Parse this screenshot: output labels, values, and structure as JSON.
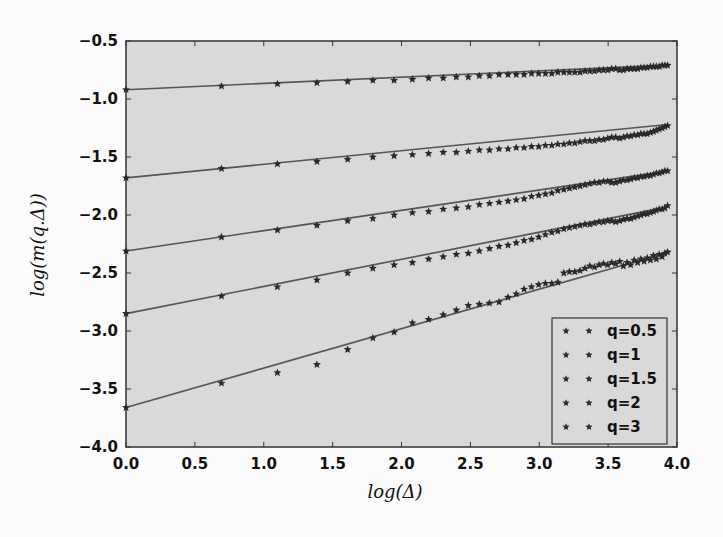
{
  "chart_data": {
    "type": "scatter",
    "title": "",
    "xlabel": "log(Δ)",
    "ylabel": "log(m(q.Δ))",
    "xlim": [
      0.0,
      4.0
    ],
    "ylim": [
      -4.0,
      -0.5
    ],
    "xticks": [
      "0.0",
      "0.5",
      "1.0",
      "1.5",
      "2.0",
      "2.5",
      "3.0",
      "3.5",
      "4.0"
    ],
    "yticks": [
      "-0.5",
      "-1.0",
      "-1.5",
      "-2.0",
      "-2.5",
      "-3.0",
      "-3.5",
      "-4.0"
    ],
    "grid": false,
    "legend_position": "lower right",
    "marker": "*",
    "fit_lines": true,
    "x": [
      0,
      0.693,
      1.099,
      1.386,
      1.609,
      1.792,
      1.946,
      2.079,
      2.197,
      2.303,
      2.398,
      2.485,
      2.565,
      2.639,
      2.708,
      2.773,
      2.833,
      2.89,
      2.944,
      2.996,
      3.045,
      3.091,
      3.135,
      3.178,
      3.219,
      3.258,
      3.296,
      3.332,
      3.367,
      3.401,
      3.434,
      3.466,
      3.497,
      3.526,
      3.555,
      3.584,
      3.611,
      3.638,
      3.664,
      3.689,
      3.714,
      3.738,
      3.761,
      3.784,
      3.807,
      3.829,
      3.85,
      3.871,
      3.892,
      3.912,
      3.932
    ],
    "series": [
      {
        "name": "q=0.5",
        "fit": {
          "intercept": -0.92,
          "slope": 0.054
        },
        "values": [
          -0.92,
          -0.89,
          -0.87,
          -0.86,
          -0.85,
          -0.84,
          -0.84,
          -0.83,
          -0.82,
          -0.82,
          -0.81,
          -0.81,
          -0.8,
          -0.8,
          -0.79,
          -0.79,
          -0.79,
          -0.79,
          -0.78,
          -0.78,
          -0.78,
          -0.78,
          -0.77,
          -0.77,
          -0.77,
          -0.77,
          -0.77,
          -0.76,
          -0.76,
          -0.76,
          -0.75,
          -0.75,
          -0.75,
          -0.74,
          -0.74,
          -0.75,
          -0.75,
          -0.74,
          -0.74,
          -0.74,
          -0.74,
          -0.73,
          -0.73,
          -0.73,
          -0.72,
          -0.72,
          -0.72,
          -0.72,
          -0.71,
          -0.71,
          -0.71
        ]
      },
      {
        "name": "q=1",
        "fit": {
          "intercept": -1.68,
          "slope": 0.117
        },
        "values": [
          -1.68,
          -1.6,
          -1.56,
          -1.54,
          -1.52,
          -1.5,
          -1.49,
          -1.48,
          -1.47,
          -1.46,
          -1.46,
          -1.45,
          -1.44,
          -1.44,
          -1.43,
          -1.43,
          -1.42,
          -1.42,
          -1.41,
          -1.41,
          -1.4,
          -1.4,
          -1.39,
          -1.39,
          -1.38,
          -1.38,
          -1.37,
          -1.36,
          -1.36,
          -1.36,
          -1.35,
          -1.35,
          -1.34,
          -1.33,
          -1.33,
          -1.34,
          -1.33,
          -1.32,
          -1.32,
          -1.31,
          -1.31,
          -1.3,
          -1.3,
          -1.3,
          -1.29,
          -1.28,
          -1.27,
          -1.26,
          -1.25,
          -1.24,
          -1.23
        ]
      },
      {
        "name": "q=1.5",
        "fit": {
          "intercept": -2.31,
          "slope": 0.175
        },
        "values": [
          -2.31,
          -2.19,
          -2.13,
          -2.09,
          -2.05,
          -2.03,
          -2.0,
          -1.98,
          -1.97,
          -1.95,
          -1.94,
          -1.93,
          -1.91,
          -1.9,
          -1.89,
          -1.88,
          -1.87,
          -1.86,
          -1.84,
          -1.83,
          -1.82,
          -1.81,
          -1.79,
          -1.78,
          -1.77,
          -1.76,
          -1.75,
          -1.74,
          -1.73,
          -1.72,
          -1.72,
          -1.71,
          -1.71,
          -1.72,
          -1.72,
          -1.71,
          -1.7,
          -1.7,
          -1.69,
          -1.68,
          -1.68,
          -1.67,
          -1.67,
          -1.66,
          -1.66,
          -1.65,
          -1.64,
          -1.64,
          -1.63,
          -1.62,
          -1.62
        ]
      },
      {
        "name": "q=2",
        "fit": {
          "intercept": -2.85,
          "slope": 0.234
        },
        "values": [
          -2.85,
          -2.7,
          -2.62,
          -2.56,
          -2.5,
          -2.46,
          -2.43,
          -2.41,
          -2.38,
          -2.36,
          -2.34,
          -2.33,
          -2.31,
          -2.29,
          -2.27,
          -2.26,
          -2.24,
          -2.22,
          -2.21,
          -2.19,
          -2.17,
          -2.15,
          -2.14,
          -2.12,
          -2.11,
          -2.1,
          -2.09,
          -2.08,
          -2.08,
          -2.07,
          -2.06,
          -2.06,
          -2.05,
          -2.05,
          -2.06,
          -2.05,
          -2.04,
          -2.03,
          -2.03,
          -2.02,
          -2.01,
          -2.0,
          -1.99,
          -1.99,
          -1.98,
          -1.97,
          -1.96,
          -1.95,
          -1.95,
          -1.94,
          -1.92
        ]
      },
      {
        "name": "q=3",
        "fit": {
          "intercept": -3.66,
          "slope": 0.34
        },
        "values": [
          -3.66,
          -3.45,
          -3.36,
          -3.29,
          -3.16,
          -3.06,
          -3.01,
          -2.93,
          -2.9,
          -2.86,
          -2.82,
          -2.78,
          -2.77,
          -2.76,
          -2.75,
          -2.71,
          -2.68,
          -2.64,
          -2.62,
          -2.6,
          -2.59,
          -2.59,
          -2.58,
          -2.5,
          -2.49,
          -2.49,
          -2.48,
          -2.46,
          -2.44,
          -2.45,
          -2.43,
          -2.42,
          -2.43,
          -2.41,
          -2.42,
          -2.4,
          -2.44,
          -2.41,
          -2.43,
          -2.39,
          -2.41,
          -2.38,
          -2.4,
          -2.37,
          -2.39,
          -2.35,
          -2.38,
          -2.34,
          -2.36,
          -2.33,
          -2.32
        ]
      }
    ]
  },
  "colors": {
    "plot_bg": "#d9d9d9",
    "page_bg": "#fbfbfb",
    "marker": "#2a2a2a",
    "fit_line": "#555555",
    "axis": "#333333"
  }
}
